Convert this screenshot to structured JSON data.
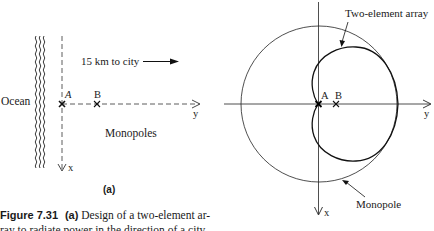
{
  "figure": {
    "panel_a": {
      "label": "(a)",
      "ocean_label": "Ocean",
      "city_label": "15 km to city",
      "element_a": "A",
      "element_b": "B",
      "monopoles_label": "Monopoles",
      "axis_x": "x",
      "axis_y": "y"
    },
    "panel_b": {
      "array_label": "Two-element array",
      "monopole_label": "Monopole",
      "element_a": "A",
      "element_b": "B",
      "axis_x": "x",
      "axis_y": "y"
    },
    "caption": {
      "number": "Figure 7.31",
      "part": "(a)",
      "line1_text": "Design of a two-element ar-",
      "line2_text": "ray to radiate power in the direction of a city"
    }
  }
}
